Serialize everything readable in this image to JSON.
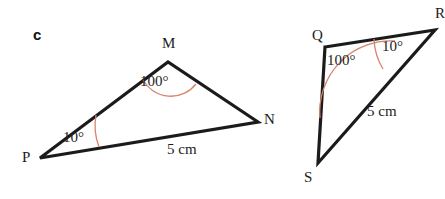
{
  "figure": {
    "part_label": "c",
    "width": 445,
    "height": 199,
    "background_color": "#ffffff",
    "line_color": "#1b1b1b",
    "arc_color": "#d9826b",
    "text_color": "#1b1b1b"
  },
  "triangle_left": {
    "name": "triangle-PMN",
    "vertices": [
      {
        "label": "M",
        "x": 168,
        "y": 62
      },
      {
        "label": "N",
        "x": 258,
        "y": 122
      },
      {
        "label": "P",
        "x": 40,
        "y": 158
      }
    ],
    "angles": [
      {
        "at": "M",
        "value": "100°"
      },
      {
        "at": "P",
        "value": "10°"
      }
    ],
    "sides": [
      {
        "between": "PN",
        "length_label": "5 cm"
      }
    ]
  },
  "triangle_right": {
    "name": "triangle-QRS",
    "vertices": [
      {
        "label": "Q",
        "x": 325,
        "y": 47
      },
      {
        "label": "R",
        "x": 435,
        "y": 30
      },
      {
        "label": "S",
        "x": 318,
        "y": 163
      }
    ],
    "angles": [
      {
        "at": "Q",
        "value": "100°"
      },
      {
        "at": "R",
        "value": "10°"
      }
    ],
    "sides": [
      {
        "between": "RS",
        "length_label": "5 cm"
      }
    ]
  }
}
